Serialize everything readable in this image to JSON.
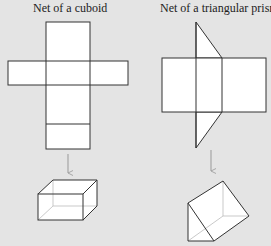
{
  "titles": {
    "cuboid": "Net of a cuboid",
    "prism": "Net of a triangular prism"
  },
  "colors": {
    "background": "#e4e4e4",
    "face_fill": "#ffffff",
    "edge": "#333333",
    "hidden_edge": "#bbbbbb",
    "arrow": "#999999"
  },
  "figures": [
    {
      "name": "cuboid-net",
      "description": "Cross-shaped net of six rectangles"
    },
    {
      "name": "cuboid-3d",
      "description": "Folded cuboid"
    },
    {
      "name": "prism-net",
      "description": "Three rectangles with two triangles"
    },
    {
      "name": "prism-3d",
      "description": "Folded triangular prism"
    }
  ]
}
